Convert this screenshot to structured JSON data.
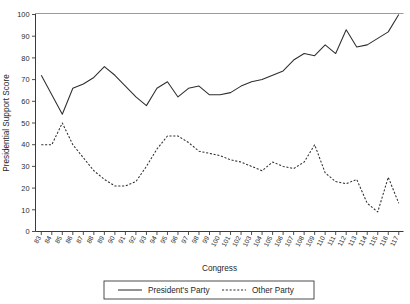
{
  "chart_data": {
    "type": "line",
    "title": "",
    "xlabel": "Congress",
    "ylabel": "Presidential Support Score",
    "ylim": [
      0,
      100
    ],
    "ytick_values": [
      0,
      10,
      20,
      30,
      40,
      50,
      60,
      70,
      80,
      90,
      100
    ],
    "grid": false,
    "legend_position": "bottom",
    "categories": [
      "83",
      "84",
      "85",
      "86",
      "87",
      "88",
      "89",
      "90",
      "91",
      "92",
      "93",
      "94",
      "95",
      "96",
      "97",
      "98",
      "99",
      "100",
      "101",
      "102",
      "103",
      "104",
      "105",
      "106",
      "107",
      "108",
      "109",
      "110",
      "111",
      "112",
      "113",
      "114",
      "115",
      "116",
      "117"
    ],
    "series": [
      {
        "name": "President's Party",
        "style": "solid",
        "color": "#2e2e2e",
        "values": [
          72,
          63,
          54,
          66,
          68,
          71,
          76,
          72,
          67,
          62,
          58,
          66,
          69,
          62,
          66,
          67,
          63,
          63,
          64,
          67,
          69,
          70,
          72,
          74,
          79,
          82,
          81,
          86,
          82,
          93,
          85,
          86,
          89,
          92,
          100
        ]
      },
      {
        "name": "Other Party",
        "style": "dashed",
        "color": "#2e2e2e",
        "values": [
          40,
          40,
          50,
          40,
          34,
          28,
          24,
          21,
          21,
          23,
          30,
          38,
          44,
          44,
          41,
          37,
          36,
          35,
          33,
          32,
          30,
          28,
          32,
          30,
          29,
          32,
          40,
          27,
          23,
          22,
          24,
          13,
          9,
          25,
          13
        ]
      }
    ]
  },
  "legend": {
    "items": [
      {
        "label": "President's Party",
        "style": "solid"
      },
      {
        "label": "Other Party",
        "style": "dashed"
      }
    ]
  }
}
